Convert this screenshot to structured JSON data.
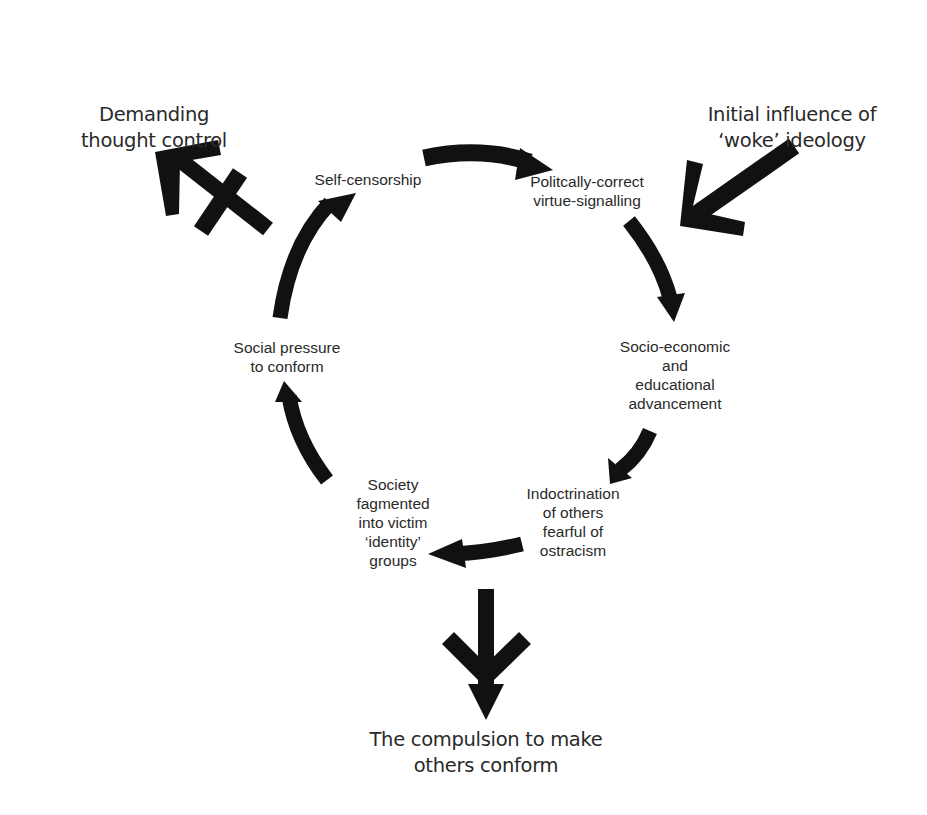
{
  "diagram": {
    "type": "cycle",
    "outer_labels": {
      "top_left": [
        "Demanding",
        "thought control"
      ],
      "top_right": [
        "Initial influence of",
        "‘woke’ ideology"
      ],
      "bottom": [
        "The compulsion to make",
        "others conform"
      ]
    },
    "cycle_nodes": [
      {
        "id": "virtue-signalling",
        "lines": [
          "Politcally-correct",
          "virtue-signalling"
        ]
      },
      {
        "id": "advancement",
        "lines": [
          "Socio-economic",
          "and",
          "educational",
          "advancement"
        ]
      },
      {
        "id": "indoctrination",
        "lines": [
          "Indoctrination",
          "of others",
          "fearful of",
          "ostracism"
        ]
      },
      {
        "id": "fragmented-society",
        "lines": [
          "Society",
          "fagmented",
          "into victim",
          "‘identity’",
          "groups"
        ]
      },
      {
        "id": "social-pressure",
        "lines": [
          "Social pressure",
          "to conform"
        ]
      },
      {
        "id": "self-censorship",
        "lines": [
          "Self-censorship"
        ]
      }
    ],
    "edges": [
      {
        "from": "self-censorship",
        "to": "virtue-signalling"
      },
      {
        "from": "virtue-signalling",
        "to": "advancement"
      },
      {
        "from": "advancement",
        "to": "indoctrination"
      },
      {
        "from": "indoctrination",
        "to": "fragmented-society"
      },
      {
        "from": "fragmented-society",
        "to": "social-pressure"
      },
      {
        "from": "social-pressure",
        "to": "self-censorship"
      }
    ],
    "external_arrows": [
      {
        "name": "input-arrow",
        "from": "Initial influence of ‘woke’ ideology",
        "to": "virtue-signalling",
        "style": "incoming"
      },
      {
        "name": "output-arrow-crossed",
        "from": "self-censorship",
        "to": "Demanding thought control",
        "style": "blocked"
      },
      {
        "name": "output-arrow-down",
        "from": "fragmented-society",
        "to": "The compulsion to make others conform",
        "style": "outgoing"
      }
    ],
    "colors": {
      "ink": "#111111",
      "text": "#2a2a2a",
      "background": "#ffffff"
    }
  }
}
